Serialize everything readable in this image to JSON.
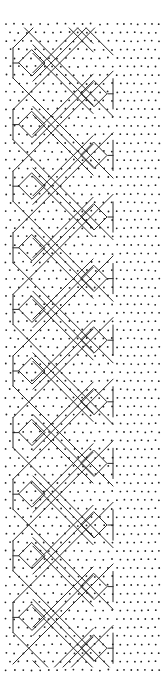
{
  "diagram": {
    "type": "bobbin-lace-pricking",
    "colors": {
      "background": "#ffffff",
      "line": "#2a2a2a",
      "dot": "#1e1e1e"
    },
    "geometry": {
      "period": 61.6,
      "first_center_y": 63,
      "repeats": 10,
      "left_edge_x": 13,
      "right_edge_x": 113,
      "left_diamond_cx": 32,
      "right_diamond_cx": 94,
      "diamond_half": 13,
      "grid_spacing": 8.5,
      "top_y": 28,
      "bottom_y": 667
    },
    "elements": {
      "left_diamonds": 10,
      "right_diamonds": 10,
      "dot_region_right_x": [
        113,
        160
      ]
    }
  }
}
